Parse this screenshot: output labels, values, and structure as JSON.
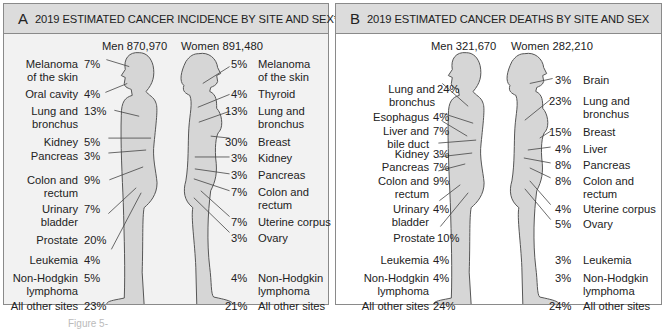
{
  "panel_a": {
    "letter": "A",
    "title": "2019 ESTIMATED CANCER INCIDENCE BY SITE AND SEX*",
    "men_total": "Men 870,970",
    "women_total": "Women 891,480",
    "men": [
      {
        "site": "Melanoma\nof the skin",
        "pct": "7%"
      },
      {
        "site": "Oral cavity",
        "pct": "4%"
      },
      {
        "site": "Lung and\nbronchus",
        "pct": "13%"
      },
      {
        "site": "Kidney",
        "pct": "5%"
      },
      {
        "site": "Pancreas",
        "pct": "3%"
      },
      {
        "site": "Colon and\nrectum",
        "pct": "9%"
      },
      {
        "site": "Urinary\nbladder",
        "pct": "7%"
      },
      {
        "site": "Prostate",
        "pct": "20%"
      },
      {
        "site": "Leukemia",
        "pct": "4%"
      },
      {
        "site": "Non-Hodgkin\nlymphoma",
        "pct": "5%"
      },
      {
        "site": "All other sites",
        "pct": "23%"
      }
    ],
    "women": [
      {
        "site": "Melanoma\nof the skin",
        "pct": "5%"
      },
      {
        "site": "Thyroid",
        "pct": "4%"
      },
      {
        "site": "Lung and\nbronchus",
        "pct": "13%"
      },
      {
        "site": "Breast",
        "pct": "30%"
      },
      {
        "site": "Kidney",
        "pct": "3%"
      },
      {
        "site": "Pancreas",
        "pct": "3%"
      },
      {
        "site": "Colon and\nrectum",
        "pct": "7%"
      },
      {
        "site": "Uterine corpus",
        "pct": "7%"
      },
      {
        "site": "Ovary",
        "pct": "3%"
      },
      {
        "site": "Non-Hodgkin\nlymphoma",
        "pct": "4%"
      },
      {
        "site": "All other sites",
        "pct": "21%"
      }
    ]
  },
  "panel_b": {
    "letter": "B",
    "title": "2019 ESTIMATED CANCER DEATHS BY SITE AND SEX",
    "men_total": "Men 321,670",
    "women_total": "Women 282,210",
    "men": [
      {
        "site": "Lung and\nbronchus",
        "pct": "24%"
      },
      {
        "site": "Esophagus",
        "pct": "4%"
      },
      {
        "site": "Liver and\nbile duct",
        "pct": "7%"
      },
      {
        "site": "Kidney",
        "pct": "3%"
      },
      {
        "site": "Pancreas",
        "pct": "7%"
      },
      {
        "site": "Colon and\nrectum",
        "pct": "9%"
      },
      {
        "site": "Urinary\nbladder",
        "pct": "4%"
      },
      {
        "site": "Prostate",
        "pct": "10%"
      },
      {
        "site": "Leukemia",
        "pct": "4%"
      },
      {
        "site": "Non-Hodgkin\nlymphoma",
        "pct": "4%"
      },
      {
        "site": "All other sites",
        "pct": "24%"
      }
    ],
    "women": [
      {
        "site": "Brain",
        "pct": "3%"
      },
      {
        "site": "Lung and\nbronchus",
        "pct": "23%"
      },
      {
        "site": "Breast",
        "pct": "15%"
      },
      {
        "site": "Liver",
        "pct": "4%"
      },
      {
        "site": "Pancreas",
        "pct": "8%"
      },
      {
        "site": "Colon and\nrectum",
        "pct": "8%"
      },
      {
        "site": "Uterine corpus",
        "pct": "4%"
      },
      {
        "site": "Ovary",
        "pct": "5%"
      },
      {
        "site": "Leukemia",
        "pct": "3%"
      },
      {
        "site": "Non-Hodgkin\nlymphoma",
        "pct": "3%"
      },
      {
        "site": "All other sites",
        "pct": "24%"
      }
    ]
  },
  "colors": {
    "header_bg": "#dcdcdc",
    "panel_a_bg": "#f2f2f2",
    "panel_b_bg": "#ffffff",
    "body_fill": "#d6d6d6",
    "outline": "#555555"
  },
  "caption": "Figure 5-"
}
